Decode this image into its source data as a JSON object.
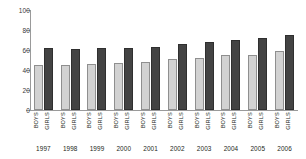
{
  "chart_data": {
    "type": "bar",
    "title": "",
    "subtitle": "",
    "xlabel": "",
    "ylabel": "",
    "ylim": [
      0,
      100
    ],
    "yticks": [
      0,
      20,
      40,
      60,
      80,
      100
    ],
    "ytick_labels": [
      "0",
      "20",
      "40",
      "60",
      "80",
      "100"
    ],
    "grid": false,
    "legend": "none",
    "legend_entries": [],
    "categories": [
      "1997",
      "1998",
      "1999",
      "2000",
      "2001",
      "2002",
      "2003",
      "2004",
      "2005",
      "2006"
    ],
    "group_labels": [
      "BOYS",
      "GIRLS"
    ],
    "series": [
      {
        "name": "BOYS",
        "color": "#d2d2d2",
        "values": [
          45,
          45,
          46,
          47,
          48,
          51,
          52,
          55,
          55,
          59
        ]
      },
      {
        "name": "GIRLS",
        "color": "#434343",
        "values": [
          62,
          61,
          62,
          62,
          63,
          66,
          68,
          70,
          72,
          75
        ]
      }
    ],
    "annotations": []
  }
}
